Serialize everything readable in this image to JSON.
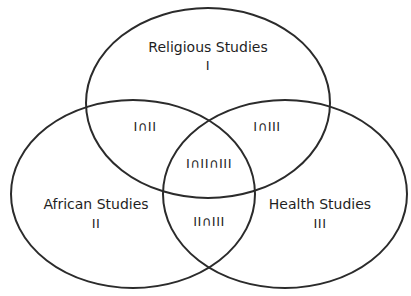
{
  "diagram": {
    "type": "venn",
    "stroke_color": "#2b2b2b",
    "sets": [
      {
        "id": "I",
        "name": "Religious Studies",
        "numeral": "I",
        "cx": 208,
        "cy": 103,
        "rx": 122,
        "ry": 95
      },
      {
        "id": "II",
        "name": "African Studies",
        "numeral": "II",
        "cx": 133,
        "cy": 194,
        "rx": 122,
        "ry": 94
      },
      {
        "id": "III",
        "name": "Health Studies",
        "numeral": "III",
        "cx": 285,
        "cy": 194,
        "rx": 122,
        "ry": 94
      }
    ],
    "intersections": {
      "i_ii": "I∩II",
      "i_iii": "I∩III",
      "ii_iii": "II∩III",
      "i_ii_iii": "I∩II∩III"
    }
  }
}
